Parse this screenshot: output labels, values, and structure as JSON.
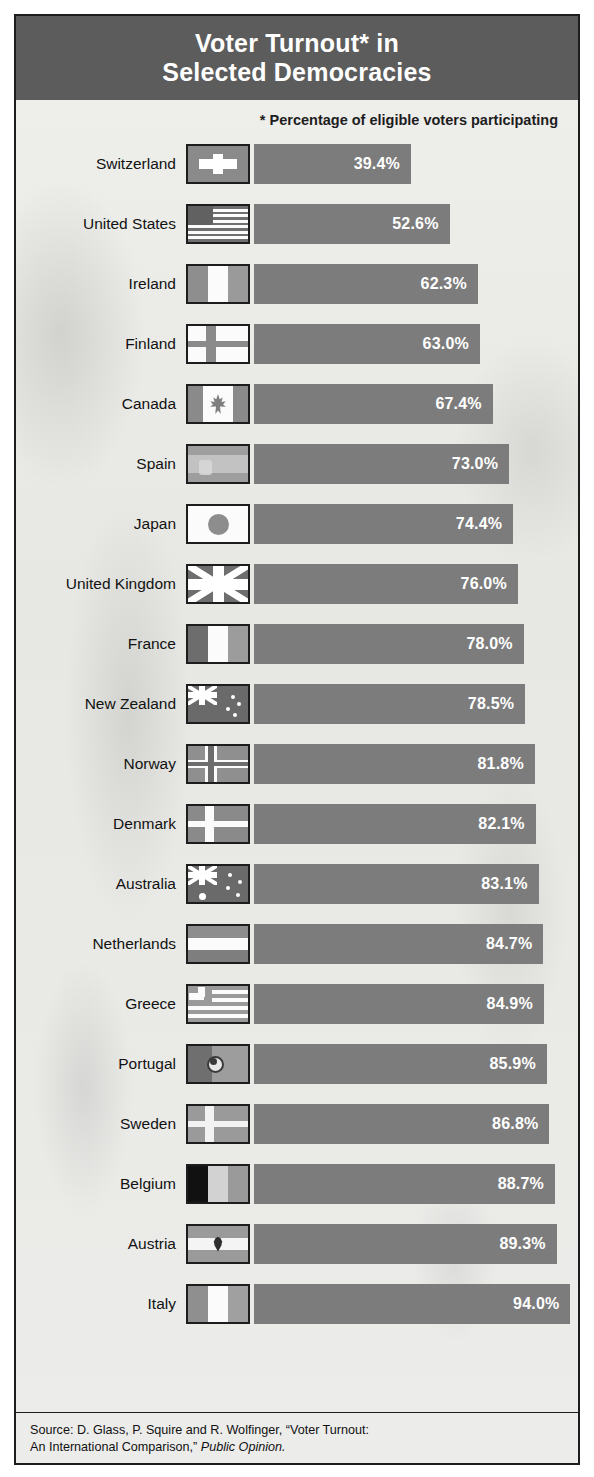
{
  "header": {
    "title_line1": "Voter Turnout* in",
    "title_line2": "Selected Democracies",
    "subtitle": "* Percentage of eligible voters participating"
  },
  "source": {
    "line1": "Source: D. Glass, P. Squire and R. Wolfinger, “Voter Turnout:",
    "line2_prefix": "An International Comparison,” ",
    "line2_italic": "Public Opinion."
  },
  "colors": {
    "header_band": "#5c5c5c",
    "bar_fill": "#7c7c7c",
    "bar_label": "#ffffff",
    "plate_background": "#e9e9e6",
    "border": "#1d1d1d",
    "text": "#121212"
  },
  "chart_data": {
    "type": "bar",
    "orientation": "horizontal",
    "title": "Voter Turnout* in Selected Democracies",
    "subtitle": "* Percentage of eligible voters participating",
    "xlabel": "",
    "ylabel": "",
    "unit": "%",
    "value_suffix": "%",
    "xlim": [
      0,
      100
    ],
    "grid": false,
    "legend": false,
    "sorted": "ascending",
    "categories": [
      "Switzerland",
      "United States",
      "Ireland",
      "Finland",
      "Canada",
      "Spain",
      "Japan",
      "United Kingdom",
      "France",
      "New Zealand",
      "Norway",
      "Denmark",
      "Australia",
      "Netherlands",
      "Greece",
      "Portugal",
      "Sweden",
      "Belgium",
      "Austria",
      "Italy"
    ],
    "values": [
      39.4,
      52.6,
      62.3,
      63.0,
      67.4,
      73.0,
      74.4,
      76.0,
      78.0,
      78.5,
      81.8,
      82.1,
      83.1,
      84.7,
      84.9,
      85.9,
      86.8,
      88.7,
      89.3,
      94.0
    ],
    "value_labels": [
      "39.4%",
      "52.6%",
      "62.3%",
      "63.0%",
      "67.4%",
      "73.0%",
      "74.4%",
      "76.0%",
      "78.0%",
      "78.5%",
      "81.8%",
      "82.1%",
      "83.1%",
      "84.7%",
      "84.9%",
      "85.9%",
      "86.8%",
      "88.7%",
      "89.3%",
      "94.0%"
    ]
  },
  "rows": [
    {
      "country": "Switzerland",
      "value": 39.4,
      "label": "39.4%",
      "flag": "switzerland"
    },
    {
      "country": "United States",
      "value": 52.6,
      "label": "52.6%",
      "flag": "united-states"
    },
    {
      "country": "Ireland",
      "value": 62.3,
      "label": "62.3%",
      "flag": "ireland"
    },
    {
      "country": "Finland",
      "value": 63.0,
      "label": "63.0%",
      "flag": "finland"
    },
    {
      "country": "Canada",
      "value": 67.4,
      "label": "67.4%",
      "flag": "canada"
    },
    {
      "country": "Spain",
      "value": 73.0,
      "label": "73.0%",
      "flag": "spain"
    },
    {
      "country": "Japan",
      "value": 74.4,
      "label": "74.4%",
      "flag": "japan"
    },
    {
      "country": "United Kingdom",
      "value": 76.0,
      "label": "76.0%",
      "flag": "united-kingdom"
    },
    {
      "country": "France",
      "value": 78.0,
      "label": "78.0%",
      "flag": "france"
    },
    {
      "country": "New Zealand",
      "value": 78.5,
      "label": "78.5%",
      "flag": "new-zealand"
    },
    {
      "country": "Norway",
      "value": 81.8,
      "label": "81.8%",
      "flag": "norway"
    },
    {
      "country": "Denmark",
      "value": 82.1,
      "label": "82.1%",
      "flag": "denmark"
    },
    {
      "country": "Australia",
      "value": 83.1,
      "label": "83.1%",
      "flag": "australia"
    },
    {
      "country": "Netherlands",
      "value": 84.7,
      "label": "84.7%",
      "flag": "netherlands"
    },
    {
      "country": "Greece",
      "value": 84.9,
      "label": "84.9%",
      "flag": "greece"
    },
    {
      "country": "Portugal",
      "value": 85.9,
      "label": "85.9%",
      "flag": "portugal"
    },
    {
      "country": "Sweden",
      "value": 86.8,
      "label": "86.8%",
      "flag": "sweden"
    },
    {
      "country": "Belgium",
      "value": 88.7,
      "label": "88.7%",
      "flag": "belgium"
    },
    {
      "country": "Austria",
      "value": 89.3,
      "label": "89.3%",
      "flag": "austria"
    },
    {
      "country": "Italy",
      "value": 94.0,
      "label": "94.0%",
      "flag": "italy"
    }
  ]
}
